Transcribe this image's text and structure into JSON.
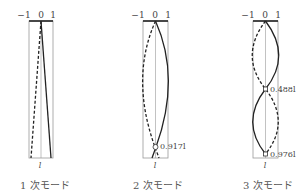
{
  "figure": {
    "axis_ticks": [
      "−1",
      "0",
      "1"
    ],
    "length_symbol": "l",
    "modes": [
      {
        "id": "mode1",
        "caption": "1 次モード",
        "nodes": []
      },
      {
        "id": "mode2",
        "caption": "2 次モード",
        "nodes": [
          {
            "position": "0.917l",
            "label": "0.917l"
          }
        ]
      },
      {
        "id": "mode3",
        "caption": "3 次モード",
        "nodes": [
          {
            "position": "0.488l",
            "label": "0.488l"
          },
          {
            "position": "0.976l",
            "label": "0.976l"
          }
        ]
      }
    ],
    "line_styles": {
      "solid": "mode shape (positive)",
      "dashed": "mode shape (mirrored)"
    },
    "colors": {
      "stroke": "#222222",
      "frame": "#888888",
      "text": "#444444"
    }
  }
}
